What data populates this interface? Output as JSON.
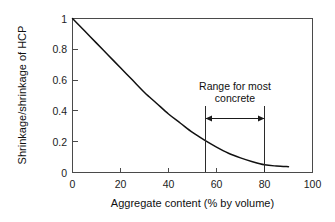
{
  "chart_data": {
    "type": "line",
    "title": "",
    "xlabel": "Aggregate content (% by volume)",
    "ylabel": "Shrinkage/shrinkage of HCP",
    "xlim": [
      0,
      100
    ],
    "ylim": [
      0,
      1
    ],
    "grid": false,
    "legend": null,
    "x_ticks": [
      "0",
      "20",
      "40",
      "60",
      "80",
      "100"
    ],
    "x_tick_values": [
      0,
      20,
      40,
      60,
      80,
      100
    ],
    "y_ticks": [
      "0",
      "0.2",
      "0.4",
      "0.6",
      "0.8",
      "1"
    ],
    "y_tick_values": [
      0,
      0.2,
      0.4,
      0.6,
      0.8,
      1
    ],
    "series": [
      {
        "name": "Shrinkage ratio",
        "x": [
          0,
          5,
          10,
          15,
          20,
          25,
          30,
          35,
          40,
          45,
          50,
          55,
          60,
          65,
          70,
          75,
          80,
          85,
          90
        ],
        "values": [
          1.0,
          0.92,
          0.84,
          0.76,
          0.68,
          0.6,
          0.52,
          0.45,
          0.38,
          0.32,
          0.26,
          0.21,
          0.165,
          0.125,
          0.095,
          0.07,
          0.05,
          0.042,
          0.038
        ]
      }
    ],
    "annotations": [
      {
        "name": "range-for-most-concrete",
        "text_line1": "Range for most",
        "text_line2": "concrete",
        "x_start": 55,
        "x_end": 80,
        "marker_top": 0.43,
        "marker_bottom": 0.0,
        "arrow_y": 0.35,
        "arrow_style": "double-headed"
      }
    ]
  },
  "axis": {
    "x_title": "Aggregate content (% by volume)",
    "y_title": "Shrinkage/shrinkage of HCP"
  },
  "annotation": {
    "line1": "Range for most",
    "line2": "concrete"
  },
  "colors": {
    "curve": "#111111",
    "axis": "#4a4a4a",
    "text": "#101010",
    "background": "#ffffff"
  }
}
